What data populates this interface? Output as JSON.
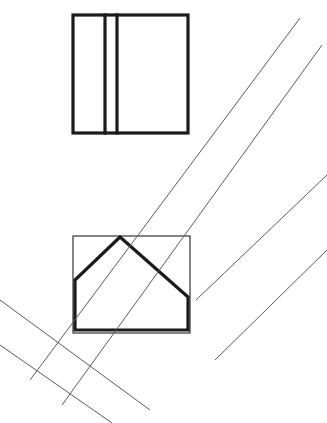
{
  "figure": {
    "background_color": "#ffffff",
    "width": 327,
    "height": 423,
    "stroke_colors": {
      "thick": "#1b1b1b",
      "thin_band": "#5a5a60",
      "thin_square": "#2b2b2b"
    },
    "stroke_widths": {
      "thick": 3.2,
      "thin_band": 1.0,
      "thin_square": 1.15
    }
  },
  "chart_data": {
    "type": "diagram",
    "shapes": [
      {
        "id": "top-divided-square",
        "kind": "rectangle",
        "style": "thick",
        "x": 73,
        "y": 15,
        "width": 115,
        "height": 118,
        "points": [
          [
            73,
            15
          ],
          [
            188,
            15
          ],
          [
            188,
            133
          ],
          [
            73,
            133
          ]
        ]
      },
      {
        "id": "top-square-divider-left",
        "kind": "line",
        "style": "thick",
        "points": [
          [
            105,
            15
          ],
          [
            105,
            133
          ]
        ]
      },
      {
        "id": "top-square-divider-right",
        "kind": "line",
        "style": "thick",
        "points": [
          [
            117,
            15
          ],
          [
            117,
            133
          ]
        ]
      },
      {
        "id": "bottom-thin-square",
        "kind": "rectangle",
        "style": "thin",
        "x": 73,
        "y": 236,
        "width": 117,
        "height": 97,
        "points": [
          [
            73,
            236
          ],
          [
            190,
            236
          ],
          [
            190,
            333
          ],
          [
            73,
            333
          ]
        ]
      },
      {
        "id": "bottom-pentagon",
        "kind": "polygon",
        "style": "thick",
        "points": [
          [
            120,
            237
          ],
          [
            188,
            297
          ],
          [
            188,
            330
          ],
          [
            75,
            330
          ],
          [
            75,
            280
          ]
        ]
      },
      {
        "id": "band-upper-line-a",
        "kind": "line",
        "style": "thin-band",
        "points": [
          [
            30,
            380
          ],
          [
            300,
            18
          ]
        ]
      },
      {
        "id": "band-upper-line-b",
        "kind": "line",
        "style": "thin-band",
        "points": [
          [
            62,
            405
          ],
          [
            322,
            45
          ]
        ]
      },
      {
        "id": "band-lower-line-a",
        "kind": "line",
        "style": "thin-band",
        "points": [
          [
            0,
            300
          ],
          [
            150,
            410
          ]
        ]
      },
      {
        "id": "band-lower-line-b",
        "kind": "line",
        "style": "thin-band",
        "points": [
          [
            0,
            345
          ],
          [
            112,
            423
          ]
        ]
      },
      {
        "id": "band-right-line-a",
        "kind": "line",
        "style": "thin-band",
        "points": [
          [
            196,
            300
          ],
          [
            327,
            175
          ]
        ]
      },
      {
        "id": "band-right-line-b",
        "kind": "line",
        "style": "thin-band",
        "points": [
          [
            215,
            360
          ],
          [
            327,
            250
          ]
        ]
      }
    ]
  }
}
